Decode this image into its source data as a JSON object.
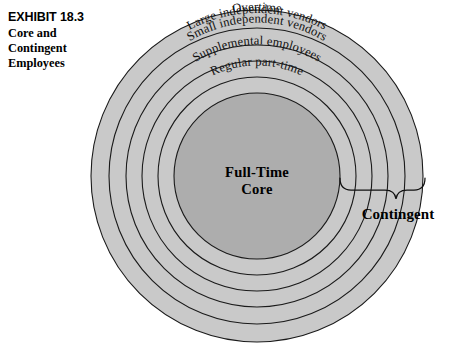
{
  "exhibit": {
    "number": "EXHIBIT 18.3",
    "title_line1": "Core and",
    "title_line2": "Contingent",
    "title_line3": "Employees"
  },
  "diagram": {
    "type": "concentric-circles",
    "center_label_line1": "Full-Time",
    "center_label_line2": "Core",
    "bracket_label": "Contingent",
    "rings": [
      {
        "label": "Overtime"
      },
      {
        "label": "Large independent vendors"
      },
      {
        "label": "Small independent vendors"
      },
      {
        "label": "Supplemental employees"
      },
      {
        "label": "Regular part-time"
      }
    ],
    "colors": {
      "ring_fill": "#c9c9c9",
      "core_fill": "#adadad",
      "stroke": "#1a1a1a",
      "text": "#000000",
      "background": "#ffffff"
    }
  }
}
